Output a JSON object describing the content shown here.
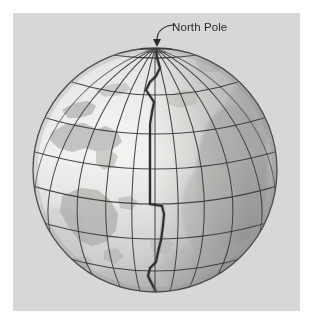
{
  "figure": {
    "kind": "globe-diagram",
    "panel": {
      "background_color": "#d7d7d7",
      "page_color": "#ffffff",
      "x": 13,
      "y": 13,
      "width": 287,
      "height": 298
    },
    "globe": {
      "center_x": 155,
      "center_y": 170,
      "radius": 122,
      "ocean_color": "#e9e9e7",
      "land_color": "#bcbcba",
      "shadow_color": "#9b9b99",
      "outline_color": "#4c4c4c",
      "graticule_color": "#3a3a3a",
      "meridian_count": 12,
      "parallel_count": 7,
      "lit_side": "left",
      "shaded_side": "right"
    },
    "dateline": {
      "name": "international-date-line",
      "color": "#2a2a2a",
      "width": 2.2,
      "description": "Heavy zigzag line running from the North Pole down the visible center of the globe, jogging east and west"
    },
    "annotations": [
      {
        "id": "north-pole",
        "label": "North Pole",
        "label_x": 172,
        "label_y": 31,
        "leader": "curved hook from label down-left to an arrowhead at the pole",
        "arrow_tip_x": 157,
        "arrow_tip_y": 46,
        "color": "#2b2b2b"
      }
    ]
  }
}
